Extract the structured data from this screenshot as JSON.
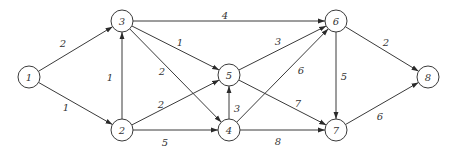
{
  "diagram": {
    "type": "directed-weighted-graph",
    "node_radius": 11,
    "colors": {
      "stroke": "#3a3a3a",
      "text": "#333333",
      "background": "#ffffff"
    },
    "nodes": [
      {
        "id": "1",
        "label": "1",
        "x": 29,
        "y": 77
      },
      {
        "id": "2",
        "label": "2",
        "x": 122,
        "y": 130
      },
      {
        "id": "3",
        "label": "3",
        "x": 122,
        "y": 21
      },
      {
        "id": "4",
        "label": "4",
        "x": 229,
        "y": 130
      },
      {
        "id": "5",
        "label": "5",
        "x": 229,
        "y": 75
      },
      {
        "id": "6",
        "label": "6",
        "x": 336,
        "y": 21
      },
      {
        "id": "7",
        "label": "7",
        "x": 336,
        "y": 130
      },
      {
        "id": "8",
        "label": "8",
        "x": 428,
        "y": 77
      }
    ],
    "edges": [
      {
        "from": "1",
        "to": "3",
        "weight": "2",
        "lx": 63,
        "ly": 43
      },
      {
        "from": "1",
        "to": "2",
        "weight": "1",
        "lx": 66,
        "ly": 107
      },
      {
        "from": "2",
        "to": "3",
        "weight": "1",
        "lx": 110,
        "ly": 77
      },
      {
        "from": "3",
        "to": "6",
        "weight": "4",
        "lx": 225,
        "ly": 15
      },
      {
        "from": "3",
        "to": "5",
        "weight": "1",
        "lx": 180,
        "ly": 42
      },
      {
        "from": "3",
        "to": "4",
        "weight": "2",
        "lx": 162,
        "ly": 71
      },
      {
        "from": "2",
        "to": "5",
        "weight": "2",
        "lx": 161,
        "ly": 104
      },
      {
        "from": "2",
        "to": "4",
        "weight": "5",
        "lx": 165,
        "ly": 142
      },
      {
        "from": "4",
        "to": "5",
        "weight": "3",
        "lx": 237,
        "ly": 108
      },
      {
        "from": "5",
        "to": "6",
        "weight": "3",
        "lx": 278,
        "ly": 41
      },
      {
        "from": "4",
        "to": "6",
        "weight": "6",
        "lx": 301,
        "ly": 70
      },
      {
        "from": "5",
        "to": "7",
        "weight": "7",
        "lx": 298,
        "ly": 103
      },
      {
        "from": "4",
        "to": "7",
        "weight": "8",
        "lx": 278,
        "ly": 141
      },
      {
        "from": "6",
        "to": "7",
        "weight": "5",
        "lx": 344,
        "ly": 76
      },
      {
        "from": "6",
        "to": "8",
        "weight": "2",
        "lx": 386,
        "ly": 42
      },
      {
        "from": "7",
        "to": "8",
        "weight": "6",
        "lx": 380,
        "ly": 116
      }
    ]
  }
}
